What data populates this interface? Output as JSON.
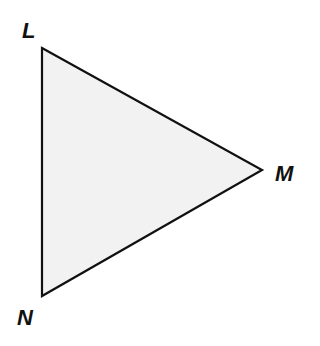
{
  "diagram": {
    "type": "triangle",
    "fill_color": "#f2f2f2",
    "stroke_color": "#111111",
    "vertices": [
      {
        "label": "L",
        "x": 42,
        "y": 48,
        "label_x": 22,
        "label_y": 38
      },
      {
        "label": "M",
        "x": 262,
        "y": 170,
        "label_x": 275,
        "label_y": 181
      },
      {
        "label": "N",
        "x": 42,
        "y": 296,
        "label_x": 17,
        "label_y": 325
      }
    ]
  }
}
